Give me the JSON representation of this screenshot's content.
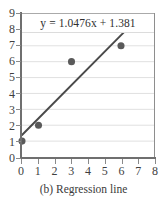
{
  "caption": "(b) Regression line",
  "equation": "y = 1.0476x + 1.381",
  "colors": {
    "marker": "#5a5a5a",
    "line": "#4a4a4a",
    "grid": "#d8d8d8",
    "axis": "#6f6f6f",
    "background": "#ffffff"
  },
  "chart_data": {
    "type": "scatter",
    "title": "",
    "subtitle": "",
    "annotations": [
      "y = 1.0476x + 1.381"
    ],
    "xlabel": "",
    "ylabel": "",
    "xlim": [
      0,
      8
    ],
    "ylim": [
      0,
      9
    ],
    "grid": true,
    "legend": null,
    "xticks": [
      0,
      1,
      2,
      3,
      4,
      5,
      6,
      7,
      8
    ],
    "yticks": [
      0,
      1,
      2,
      3,
      4,
      5,
      6,
      7,
      8,
      9
    ],
    "xtick_labels": [
      "0",
      "1",
      "2",
      "3",
      "4",
      "5",
      "6",
      "7",
      "8"
    ],
    "ytick_labels": [
      "0",
      "1",
      "2",
      "3",
      "4",
      "5",
      "6",
      "7",
      "8",
      "9"
    ],
    "series": [
      {
        "name": "data points",
        "type": "scatter",
        "x": [
          0,
          1,
          3,
          6
        ],
        "y": [
          1,
          2,
          6,
          7
        ]
      },
      {
        "name": "regression line",
        "type": "line",
        "slope": 1.0476,
        "intercept": 1.381,
        "x": [
          0,
          6.2
        ],
        "y": [
          1.381,
          7.876
        ]
      }
    ]
  }
}
